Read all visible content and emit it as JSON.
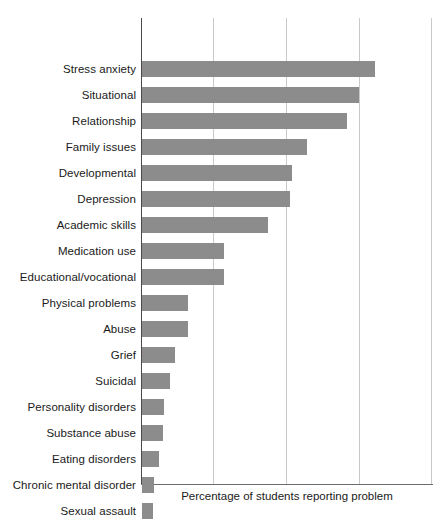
{
  "chart_data": {
    "type": "bar",
    "orientation": "horizontal",
    "title": "",
    "xlabel": "Percentage of students reporting problem",
    "ylabel": "",
    "xlim": [
      0,
      40
    ],
    "grid": true,
    "gridlines_x": [
      10,
      20,
      30,
      40
    ],
    "tick_labels_x": [],
    "legend": null,
    "bar_color": "#8c8c8c",
    "categories": [
      "Stress anxiety",
      "Situational",
      "Relationship",
      "Family issues",
      "Developmental",
      "Depression",
      "Academic skills",
      "Medication use",
      "Educational/vocational",
      "Physical problems",
      "Abuse",
      "Grief",
      "Suicidal",
      "Personality disorders",
      "Substance abuse",
      "Eating disorders",
      "Chronic mental disorder",
      "Sexual assault"
    ],
    "values": [
      32.1,
      29.9,
      28.3,
      22.8,
      20.7,
      20.4,
      17.4,
      11.3,
      11.3,
      6.3,
      6.4,
      4.6,
      3.8,
      3.1,
      2.9,
      2.4,
      1.7,
      1.5
    ]
  }
}
